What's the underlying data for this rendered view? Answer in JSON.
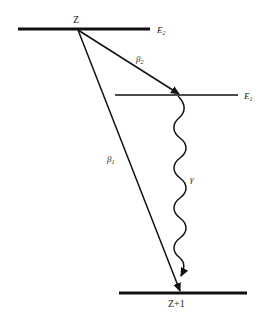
{
  "diagram": {
    "levels": [
      {
        "id": "E2",
        "label": "E",
        "subscript": "2",
        "nuclide": "Z"
      },
      {
        "id": "E1",
        "label": "E",
        "subscript": "1"
      },
      {
        "id": "ground",
        "nuclide": "Z+1"
      }
    ],
    "transitions": [
      {
        "id": "beta1",
        "label": "β",
        "subscript": "1",
        "from": "E2",
        "to": "ground",
        "type": "beta"
      },
      {
        "id": "beta2",
        "label": "β",
        "subscript": "2",
        "from": "E2",
        "to": "E1",
        "type": "beta"
      },
      {
        "id": "gamma",
        "label": "γ",
        "from": "E1",
        "to": "ground",
        "type": "gamma"
      }
    ],
    "colors": {
      "line": "#111111",
      "text": "#222222",
      "background": "#ffffff"
    }
  }
}
